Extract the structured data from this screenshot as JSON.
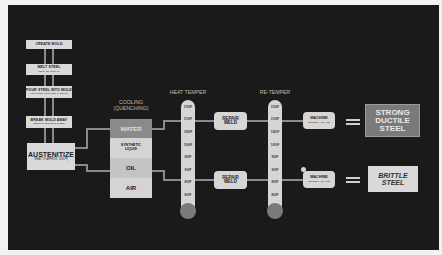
{
  "process": {
    "steps": [
      {
        "label": "CREATE MOLD",
        "sub": ""
      },
      {
        "label": "MELT STEEL",
        "sub": "(NEW OR SCRAP)"
      },
      {
        "label": "POUR STEEL INTO MOLD",
        "sub": "(LET COOL INTO METAL SOLID)"
      },
      {
        "label": "BREAK MOLD AWAY",
        "sub": "REMOVE SPRUE & RISER"
      }
    ],
    "austenitize": {
      "label": "AUSTENITIZE",
      "sub": "(HEAT TO APPROX. 1650°F)"
    }
  },
  "cooling": {
    "title_line1": "COOLING",
    "title_line2": "(QUENCHING)",
    "options": [
      {
        "label": "WATER",
        "color": "#8a8a8a"
      },
      {
        "label": "SYNTHETIC LIQUID",
        "color": "#d4d4d4"
      },
      {
        "label": "OIL",
        "color": "#c4c4c4"
      },
      {
        "label": "AIR",
        "color": "#d4d4d4"
      }
    ]
  },
  "heat_temper": {
    "title": "HEAT TEMPER",
    "ticks": [
      "1150F",
      "1100F",
      "1050F",
      "1000F",
      "950F",
      "900F",
      "850F",
      "800F"
    ]
  },
  "re_temper": {
    "title": "RE-TEMPER",
    "ticks": [
      "1150F",
      "1100F",
      "1050F",
      "1000F",
      "950F",
      "900F",
      "850F",
      "800F"
    ]
  },
  "repair_weld": {
    "line1": "REPAIR",
    "line2": "WELD"
  },
  "machine": {
    "label": "MACHINE",
    "sub": "(SMOOTH / SHAPE)"
  },
  "results": {
    "good": {
      "line1": "STRONG",
      "line2": "DUCTILE",
      "line3": "STEEL",
      "color": "#7a7a7a"
    },
    "bad": {
      "line1": "BRITTLE",
      "line2": "STEEL",
      "color": "#d9d9d9"
    }
  }
}
